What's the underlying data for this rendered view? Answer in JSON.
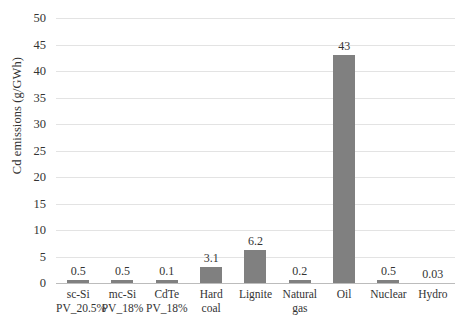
{
  "chart_data": {
    "type": "bar",
    "title": "",
    "xlabel": "",
    "ylabel": "Cd emissions (g/GWh)",
    "ylim": [
      0,
      50
    ],
    "ytick_step": 5,
    "yticks": [
      50,
      45,
      40,
      35,
      30,
      25,
      20,
      15,
      10,
      5,
      0
    ],
    "grid": true,
    "legend": "none",
    "bar_color": "#808080",
    "gridline_color": "#e3e3e3",
    "axis_color": "#bcbcbc",
    "categories": [
      {
        "line1": "sc-Si",
        "line2": "PV_20.5%"
      },
      {
        "line1": "mc-Si",
        "line2": "PV_18%"
      },
      {
        "line1": "CdTe",
        "line2": "PV_18%"
      },
      {
        "line1": "Hard",
        "line2": "coal"
      },
      {
        "line1": "Lignite",
        "line2": ""
      },
      {
        "line1": "Natural",
        "line2": "gas"
      },
      {
        "line1": "Oil",
        "line2": ""
      },
      {
        "line1": "Nuclear",
        "line2": ""
      },
      {
        "line1": "Hydro",
        "line2": ""
      }
    ],
    "values": [
      0.5,
      0.5,
      0.1,
      3.1,
      6.2,
      0.2,
      43,
      0.5,
      0.03
    ],
    "value_labels": [
      "0.5",
      "0.5",
      "0.1",
      "3.1",
      "6.2",
      "0.2",
      "43",
      "0.5",
      "0.03"
    ]
  }
}
